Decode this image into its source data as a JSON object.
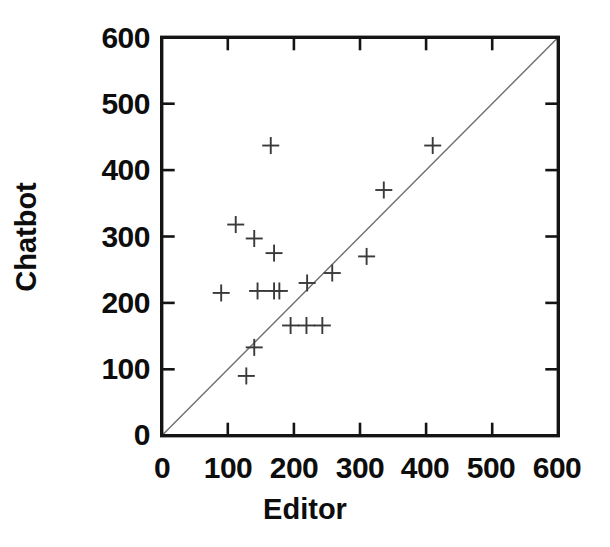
{
  "chart_data": {
    "type": "scatter",
    "title": "",
    "xlabel": "Editor",
    "ylabel": "Chatbot",
    "xlim": [
      0,
      600
    ],
    "ylim": [
      0,
      600
    ],
    "xticks": [
      0,
      100,
      200,
      300,
      400,
      500,
      600
    ],
    "yticks": [
      0,
      100,
      200,
      300,
      400,
      500,
      600
    ],
    "xtick_labels": [
      "0",
      "100",
      "200",
      "300",
      "400",
      "500",
      "600"
    ],
    "ytick_labels": [
      "0",
      "100",
      "200",
      "300",
      "400",
      "500",
      "600"
    ],
    "grid": false,
    "legend": null,
    "marker_style": "plus",
    "marker_color": "#3a3a3a",
    "reference_line": {
      "description": "identity line y = x",
      "from": [
        0,
        0
      ],
      "to": [
        600,
        600
      ],
      "color": "#6e6e6e"
    },
    "points": [
      {
        "x": 90,
        "y": 215
      },
      {
        "x": 112,
        "y": 318
      },
      {
        "x": 128,
        "y": 90
      },
      {
        "x": 140,
        "y": 133
      },
      {
        "x": 140,
        "y": 297
      },
      {
        "x": 145,
        "y": 218
      },
      {
        "x": 165,
        "y": 437
      },
      {
        "x": 170,
        "y": 218
      },
      {
        "x": 178,
        "y": 218
      },
      {
        "x": 170,
        "y": 275
      },
      {
        "x": 195,
        "y": 166
      },
      {
        "x": 219,
        "y": 166
      },
      {
        "x": 220,
        "y": 230
      },
      {
        "x": 243,
        "y": 166
      },
      {
        "x": 258,
        "y": 245
      },
      {
        "x": 310,
        "y": 270
      },
      {
        "x": 336,
        "y": 370
      },
      {
        "x": 410,
        "y": 437
      }
    ]
  },
  "axes": {
    "x_title": "Editor",
    "y_title": "Chatbot"
  },
  "ticks": {
    "x": [
      "0",
      "100",
      "200",
      "300",
      "400",
      "500",
      "600"
    ],
    "y": [
      "0",
      "100",
      "200",
      "300",
      "400",
      "500",
      "600"
    ]
  }
}
